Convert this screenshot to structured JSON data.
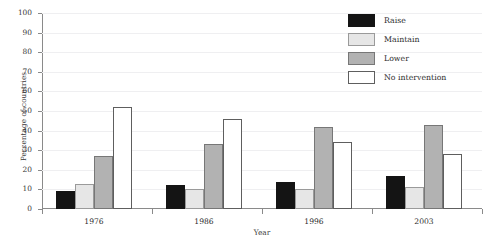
{
  "chart_data": {
    "type": "bar",
    "title": "",
    "xlabel": "Year",
    "ylabel": "Percentage of countries",
    "categories": [
      "1976",
      "1986",
      "1996",
      "2003"
    ],
    "ylim": [
      0,
      100
    ],
    "ytick_step": 10,
    "yticks": [
      "100",
      "90",
      "80",
      "70",
      "60",
      "50",
      "40",
      "30",
      "20",
      "10",
      "0"
    ],
    "grid": true,
    "legend_position": "top-right",
    "series": [
      {
        "name": "Raise",
        "color": "#141414",
        "values": [
          9,
          12,
          14,
          17
        ]
      },
      {
        "name": "Maintain",
        "color": "#e6e6e6",
        "values": [
          13,
          10,
          10,
          11
        ]
      },
      {
        "name": "Lower",
        "color": "#b2b2b2",
        "values": [
          27,
          33,
          42,
          43
        ]
      },
      {
        "name": "No intervention",
        "color": "#ffffff",
        "values": [
          52,
          46,
          34,
          28
        ]
      }
    ]
  }
}
